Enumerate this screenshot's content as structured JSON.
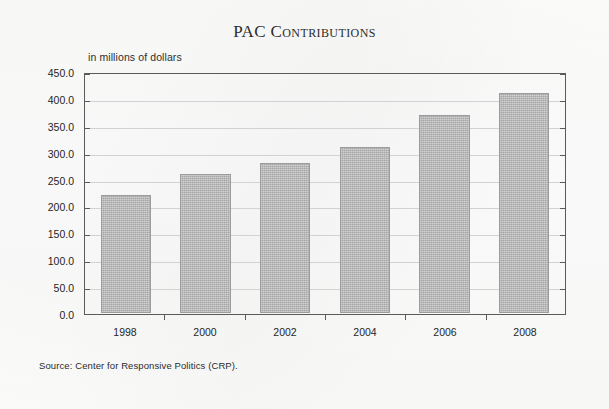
{
  "chart_data": {
    "type": "bar",
    "title": "PAC Contributions",
    "subtitle": "in millions of dollars",
    "categories": [
      "1998",
      "2000",
      "2002",
      "2004",
      "2006",
      "2008"
    ],
    "values": [
      220,
      260,
      280,
      310,
      370,
      410
    ],
    "series": [
      {
        "name": "PAC Contributions",
        "values": [
          220,
          260,
          280,
          310,
          370,
          410
        ]
      }
    ],
    "xlabel": "",
    "ylabel": "in millions of dollars",
    "ylim": [
      0,
      450
    ],
    "ytick_step": 50,
    "ytick_labels": [
      "0.0",
      "50.0",
      "100.0",
      "150.0",
      "200.0",
      "250.0",
      "300.0",
      "350.0",
      "400.0",
      "450.0"
    ],
    "grid": true,
    "legend": false,
    "legend_position": "none",
    "source": "Source: Center for Responsive Politics (CRP).",
    "bar_color": "#b6b6b6",
    "bar_edge_color": "#9c9c9c",
    "axis_color": "#5a5a5a",
    "grid_color": "#d2d2d2",
    "background_color": "#fdfdfd"
  }
}
